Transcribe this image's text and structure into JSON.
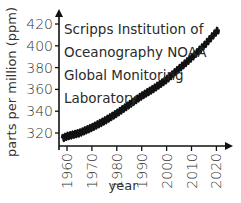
{
  "chart_data": {
    "type": "line",
    "title": "",
    "xlabel": "year",
    "ylabel": "parts per million (ppm)",
    "annotation": [
      "Scripps Institution of",
      "Oceanography NOAA",
      "Global Monitoring",
      "Laboratory"
    ],
    "xlim": [
      1957,
      2024
    ],
    "ylim": [
      310,
      430
    ],
    "x_ticks": [
      1960,
      1970,
      1980,
      1990,
      2000,
      2010,
      2020
    ],
    "y_ticks": [
      320,
      340,
      360,
      380,
      400,
      420
    ],
    "grid": false,
    "legend": null,
    "series": [
      {
        "name": "Atmospheric CO2 (Keeling curve)",
        "color": "#111111",
        "x": [
          1958,
          1960,
          1965,
          1970,
          1975,
          1980,
          1985,
          1990,
          1995,
          2000,
          2005,
          2010,
          2015,
          2020,
          2021
        ],
        "values": [
          315,
          317,
          320,
          325,
          331,
          338,
          346,
          354,
          361,
          369,
          379,
          389,
          400,
          413,
          415
        ]
      }
    ]
  }
}
